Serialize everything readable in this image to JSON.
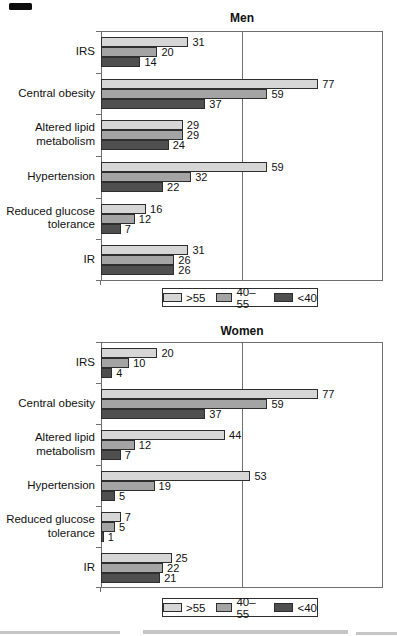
{
  "figure": {
    "background": "#ffffff",
    "has_scan_mark_top_left": true,
    "cropped_caption_note": "unreadable cut-off text row at image bottom"
  },
  "palette": {
    "bar_light": "#d6d6d6",
    "bar_mid": "#a4a4a4",
    "bar_dark": "#4f4f4f",
    "bar_border": "#2e2e2e",
    "plot_border": "#6f6f6f",
    "text": "#111111"
  },
  "legend": {
    "items": [
      {
        "label": ">55",
        "swatch": "#d6d6d6"
      },
      {
        "label": "40–55",
        "swatch": "#a4a4a4"
      },
      {
        "label": "<40",
        "swatch": "#4f4f4f"
      }
    ]
  },
  "chart_data": [
    {
      "type": "bar",
      "orientation": "horizontal",
      "title": "Men",
      "categories": [
        "IRS",
        "Central obesity",
        "Altered lipid\nmetabolism",
        "Hypertension",
        "Reduced glucose\ntolerance",
        "IR"
      ],
      "series": [
        {
          "name": ">55",
          "color": "#d6d6d6",
          "values": [
            31,
            77,
            29,
            59,
            16,
            31
          ]
        },
        {
          "name": "40–55",
          "color": "#a4a4a4",
          "values": [
            20,
            59,
            29,
            32,
            12,
            26
          ]
        },
        {
          "name": "<40",
          "color": "#4f4f4f",
          "values": [
            14,
            37,
            24,
            22,
            7,
            26
          ]
        }
      ],
      "xlim": [
        0,
        100
      ],
      "gridlines_x": [
        50
      ],
      "grid": "single-vertical-line",
      "data_labels": true,
      "legend_position": "bottom"
    },
    {
      "type": "bar",
      "orientation": "horizontal",
      "title": "Women",
      "categories": [
        "IRS",
        "Central obesity",
        "Altered lipid\nmetabolism",
        "Hypertension",
        "Reduced glucose\ntolerance",
        "IR"
      ],
      "series": [
        {
          "name": ">55",
          "color": "#d6d6d6",
          "values": [
            20,
            77,
            44,
            53,
            7,
            25
          ]
        },
        {
          "name": "40–55",
          "color": "#a4a4a4",
          "values": [
            10,
            59,
            12,
            19,
            5,
            22
          ]
        },
        {
          "name": "<40",
          "color": "#4f4f4f",
          "values": [
            4,
            37,
            7,
            5,
            1,
            21
          ]
        }
      ],
      "xlim": [
        0,
        100
      ],
      "gridlines_x": [
        50
      ],
      "grid": "single-vertical-line",
      "data_labels": true,
      "legend_position": "bottom"
    }
  ]
}
